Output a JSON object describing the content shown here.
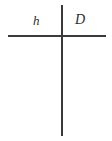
{
  "diagram": {
    "type": "axis-cross",
    "background_color": "#ffffff",
    "line_color": "#3a3a3a",
    "text_color": "#2e2e2e",
    "lines": [
      {
        "name": "horizontal-axis",
        "orientation": "horizontal",
        "x1": 8,
        "y1": 36,
        "x2": 106,
        "y2": 36,
        "thickness": 2
      },
      {
        "name": "vertical-axis",
        "orientation": "vertical",
        "x1": 62,
        "y1": 5,
        "x2": 62,
        "y2": 136,
        "thickness": 2
      }
    ],
    "intersection": {
      "x": 62,
      "y": 36
    },
    "labels": [
      {
        "name": "label-h",
        "text": "h",
        "style": "italic-serif",
        "x": 36,
        "y": 21,
        "region": "upper-left"
      },
      {
        "name": "label-D",
        "text": "D",
        "style": "italic-serif",
        "x": 80,
        "y": 21,
        "region": "upper-right"
      }
    ]
  }
}
